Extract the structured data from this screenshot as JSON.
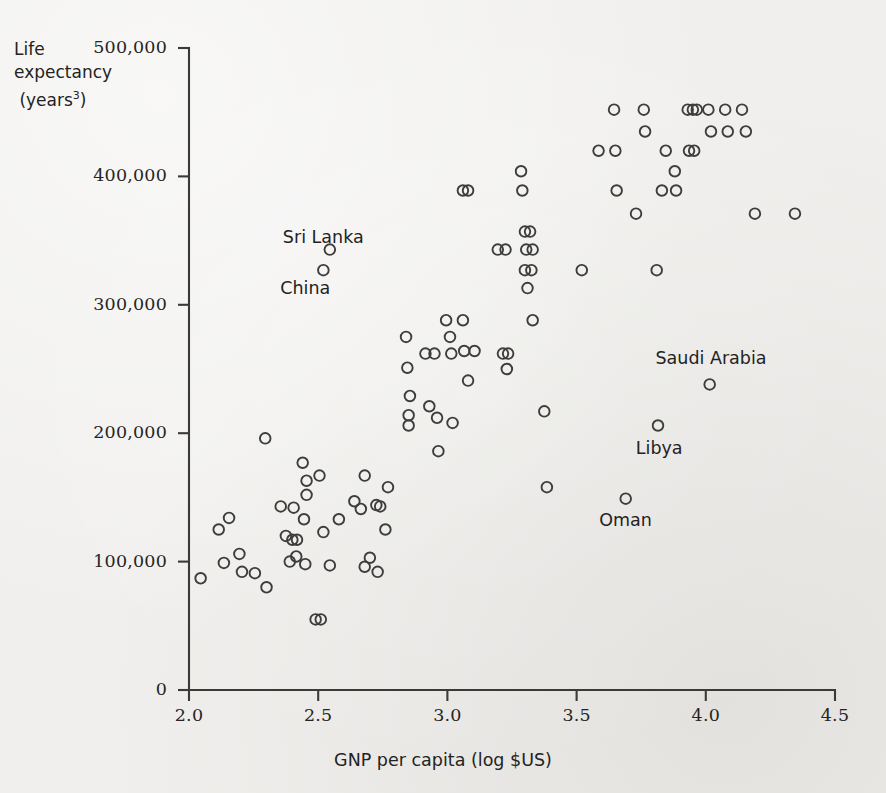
{
  "chart_data": {
    "type": "scatter",
    "title": "",
    "xlabel": "GNP per capita (log $US)",
    "ylabel": "Life expectancy (years³)",
    "ylabel_lines": [
      "Life",
      "expectancy",
      "(years",
      "3",
      ")"
    ],
    "xlim": [
      2.0,
      4.5
    ],
    "ylim": [
      0,
      500000
    ],
    "xticks": [
      "2.0",
      "2.5",
      "3.0",
      "3.5",
      "4.0",
      "4.5"
    ],
    "xtick_values": [
      2.0,
      2.5,
      3.0,
      3.5,
      4.0,
      4.5
    ],
    "yticks": [
      "0",
      "100,000",
      "200,000",
      "300,000",
      "400,000",
      "500,000"
    ],
    "ytick_values": [
      0,
      100000,
      200000,
      300000,
      400000,
      500000
    ],
    "grid": false,
    "legend": null,
    "marker": "open-circle",
    "marker_color": "#3d3d3b",
    "background_color": "#f0efed",
    "axis_color": "#3a3a38",
    "annotations": [
      {
        "label": "Sri Lanka",
        "x": 2.52,
        "y": 352000
      },
      {
        "label": "China",
        "x": 2.45,
        "y": 312000
      },
      {
        "label": "Saudi Arabia",
        "x": 4.02,
        "y": 258000
      },
      {
        "label": "Libya",
        "x": 3.82,
        "y": 188000
      },
      {
        "label": "Oman",
        "x": 3.69,
        "y": 132000
      }
    ],
    "points": [
      {
        "x": 2.045,
        "y": 87000
      },
      {
        "x": 2.115,
        "y": 125000
      },
      {
        "x": 2.155,
        "y": 134000
      },
      {
        "x": 2.135,
        "y": 99000
      },
      {
        "x": 2.195,
        "y": 106000
      },
      {
        "x": 2.205,
        "y": 92000
      },
      {
        "x": 2.255,
        "y": 91000
      },
      {
        "x": 2.295,
        "y": 196000
      },
      {
        "x": 2.3,
        "y": 80000
      },
      {
        "x": 2.355,
        "y": 143000
      },
      {
        "x": 2.375,
        "y": 120000
      },
      {
        "x": 2.405,
        "y": 142000
      },
      {
        "x": 2.4,
        "y": 117000
      },
      {
        "x": 2.418,
        "y": 117000
      },
      {
        "x": 2.39,
        "y": 100000
      },
      {
        "x": 2.415,
        "y": 104000
      },
      {
        "x": 2.44,
        "y": 177000
      },
      {
        "x": 2.455,
        "y": 163000
      },
      {
        "x": 2.455,
        "y": 152000
      },
      {
        "x": 2.445,
        "y": 133000
      },
      {
        "x": 2.45,
        "y": 98000
      },
      {
        "x": 2.49,
        "y": 55000
      },
      {
        "x": 2.51,
        "y": 55000
      },
      {
        "x": 2.505,
        "y": 167000
      },
      {
        "x": 2.52,
        "y": 327000
      },
      {
        "x": 2.545,
        "y": 343000
      },
      {
        "x": 2.52,
        "y": 123000
      },
      {
        "x": 2.545,
        "y": 97000
      },
      {
        "x": 2.58,
        "y": 133000
      },
      {
        "x": 2.64,
        "y": 147000
      },
      {
        "x": 2.665,
        "y": 141000
      },
      {
        "x": 2.68,
        "y": 167000
      },
      {
        "x": 2.68,
        "y": 96000
      },
      {
        "x": 2.7,
        "y": 103000
      },
      {
        "x": 2.725,
        "y": 144000
      },
      {
        "x": 2.74,
        "y": 143000
      },
      {
        "x": 2.73,
        "y": 92000
      },
      {
        "x": 2.76,
        "y": 125000
      },
      {
        "x": 2.77,
        "y": 158000
      },
      {
        "x": 2.84,
        "y": 275000
      },
      {
        "x": 2.845,
        "y": 251000
      },
      {
        "x": 2.855,
        "y": 229000
      },
      {
        "x": 2.85,
        "y": 214000
      },
      {
        "x": 2.85,
        "y": 206000
      },
      {
        "x": 2.915,
        "y": 262000
      },
      {
        "x": 2.93,
        "y": 221000
      },
      {
        "x": 2.95,
        "y": 262000
      },
      {
        "x": 2.96,
        "y": 212000
      },
      {
        "x": 2.965,
        "y": 186000
      },
      {
        "x": 2.995,
        "y": 288000
      },
      {
        "x": 3.01,
        "y": 275000
      },
      {
        "x": 3.015,
        "y": 262000
      },
      {
        "x": 3.02,
        "y": 208000
      },
      {
        "x": 3.06,
        "y": 389000
      },
      {
        "x": 3.08,
        "y": 389000
      },
      {
        "x": 3.06,
        "y": 288000
      },
      {
        "x": 3.065,
        "y": 264000
      },
      {
        "x": 3.08,
        "y": 241000
      },
      {
        "x": 3.105,
        "y": 264000
      },
      {
        "x": 3.195,
        "y": 343000
      },
      {
        "x": 3.225,
        "y": 343000
      },
      {
        "x": 3.215,
        "y": 262000
      },
      {
        "x": 3.235,
        "y": 262000
      },
      {
        "x": 3.23,
        "y": 250000
      },
      {
        "x": 3.285,
        "y": 404000
      },
      {
        "x": 3.29,
        "y": 389000
      },
      {
        "x": 3.3,
        "y": 357000
      },
      {
        "x": 3.32,
        "y": 357000
      },
      {
        "x": 3.305,
        "y": 343000
      },
      {
        "x": 3.33,
        "y": 343000
      },
      {
        "x": 3.3,
        "y": 327000
      },
      {
        "x": 3.325,
        "y": 327000
      },
      {
        "x": 3.31,
        "y": 313000
      },
      {
        "x": 3.33,
        "y": 288000
      },
      {
        "x": 3.375,
        "y": 217000
      },
      {
        "x": 3.385,
        "y": 158000
      },
      {
        "x": 3.52,
        "y": 327000
      },
      {
        "x": 3.585,
        "y": 420000
      },
      {
        "x": 3.645,
        "y": 452000
      },
      {
        "x": 3.65,
        "y": 420000
      },
      {
        "x": 3.655,
        "y": 389000
      },
      {
        "x": 3.69,
        "y": 149000
      },
      {
        "x": 3.73,
        "y": 371000
      },
      {
        "x": 3.76,
        "y": 452000
      },
      {
        "x": 3.765,
        "y": 435000
      },
      {
        "x": 3.815,
        "y": 206000
      },
      {
        "x": 3.81,
        "y": 327000
      },
      {
        "x": 3.83,
        "y": 389000
      },
      {
        "x": 3.845,
        "y": 420000
      },
      {
        "x": 3.88,
        "y": 404000
      },
      {
        "x": 3.885,
        "y": 389000
      },
      {
        "x": 3.93,
        "y": 452000
      },
      {
        "x": 3.95,
        "y": 452000
      },
      {
        "x": 3.965,
        "y": 452000
      },
      {
        "x": 3.935,
        "y": 420000
      },
      {
        "x": 3.955,
        "y": 420000
      },
      {
        "x": 4.015,
        "y": 238000
      },
      {
        "x": 4.01,
        "y": 452000
      },
      {
        "x": 4.02,
        "y": 435000
      },
      {
        "x": 4.075,
        "y": 452000
      },
      {
        "x": 4.085,
        "y": 435000
      },
      {
        "x": 4.14,
        "y": 452000
      },
      {
        "x": 4.155,
        "y": 435000
      },
      {
        "x": 4.19,
        "y": 371000
      },
      {
        "x": 4.345,
        "y": 371000
      }
    ]
  },
  "figure": {
    "caption": ""
  }
}
